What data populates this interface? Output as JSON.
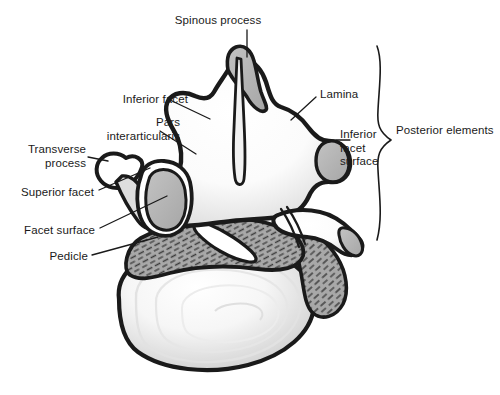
{
  "figure": {
    "domain_subject": "lumbar vertebra anatomy illustration",
    "background_color": "#ffffff",
    "ink_color": "#1a1a1a",
    "fill_bone_light": "#fdfdfd",
    "fill_bone_shadow": "#dcdcdc",
    "fill_facet_gray": "#b5b5b5",
    "fill_cut_bone_gray": "#a8a8a8",
    "hatch_color": "#3a3a3a"
  },
  "labels": [
    {
      "id": "spinous-process",
      "text": "Spinous process",
      "x": 218,
      "y": 14,
      "align": "center",
      "leader": "vertical line down to spinous process tip"
    },
    {
      "id": "inferior-facet",
      "text": "Inferior facet",
      "x": 98,
      "y": 93,
      "align": "left",
      "leader": "diagonal line to left superior-articular ridge"
    },
    {
      "id": "pars-interarticularis",
      "text": "Pars\ninterarticularis",
      "x": 85,
      "y": 116,
      "align": "right",
      "leader": "diagonal line to pars region"
    },
    {
      "id": "transverse-process",
      "text": "Transverse\nprocess",
      "x": 26,
      "y": 143,
      "align": "right",
      "leader": "horizontal line to transverse process knob"
    },
    {
      "id": "superior-facet",
      "text": "Superior facet",
      "x": 13,
      "y": 186,
      "align": "right",
      "leader": "diagonal line up-right to superior facet"
    },
    {
      "id": "facet-surface",
      "text": "Facet surface",
      "x": 18,
      "y": 224,
      "align": "right",
      "leader": "diagonal line up-right to gray facet surface"
    },
    {
      "id": "pedicle",
      "text": "Pedicle",
      "x": 48,
      "y": 250,
      "align": "right",
      "leader": "diagonal line up-right to pedicle cut surface"
    },
    {
      "id": "lamina",
      "text": "Lamina",
      "x": 318,
      "y": 88,
      "align": "left",
      "leader": "diagonal line down-left to lamina"
    },
    {
      "id": "inferior-facet-surface",
      "text": "Inferior\nfacet\nsurface",
      "x": 340,
      "y": 128,
      "align": "left",
      "leader": "short horizontal line left to gray facet oval"
    },
    {
      "id": "posterior-elements",
      "text": "Posterior elements",
      "x": 396,
      "y": 124,
      "align": "left",
      "leader": "none"
    }
  ],
  "brace": {
    "id": "posterior-elements-brace",
    "top_y": 46,
    "bottom_y": 240,
    "tip_x": 391,
    "tip_y": 140,
    "stem_x": 377
  },
  "structures": [
    {
      "id": "spinous-process",
      "name": "Spinous process"
    },
    {
      "id": "lamina",
      "name": "Lamina"
    },
    {
      "id": "inferior-facet",
      "name": "Inferior facet"
    },
    {
      "id": "inferior-facet-surface",
      "name": "Inferior facet surface"
    },
    {
      "id": "superior-facet",
      "name": "Superior facet"
    },
    {
      "id": "facet-surface",
      "name": "Facet surface"
    },
    {
      "id": "transverse-process",
      "name": "Transverse process"
    },
    {
      "id": "pars-interarticularis",
      "name": "Pars interarticularis"
    },
    {
      "id": "pedicle",
      "name": "Pedicle"
    },
    {
      "id": "vertebral-body",
      "name": "Vertebral body"
    }
  ]
}
